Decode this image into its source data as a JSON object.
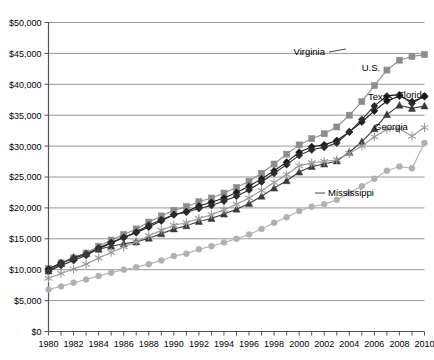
{
  "chart_data": {
    "type": "line",
    "title": "",
    "subtitle": "",
    "xlabel": "",
    "ylabel": "",
    "xlim": [
      1980,
      2010
    ],
    "ylim": [
      0,
      50000
    ],
    "ytick_values": [
      0,
      5000,
      10000,
      15000,
      20000,
      25000,
      30000,
      35000,
      40000,
      45000,
      50000
    ],
    "ytick_labels": [
      "$0",
      "$5,000",
      "$10,000",
      "$15,000",
      "$20,000",
      "$25,000",
      "$30,000",
      "$35,000",
      "$40,000",
      "$45,000",
      "$50,000"
    ],
    "xtick_labels": [
      "1980",
      "1982",
      "1984",
      "1986",
      "1988",
      "1990",
      "1992",
      "1994",
      "1996",
      "1998",
      "2000",
      "2002",
      "2004",
      "2006",
      "2008",
      "2010"
    ],
    "xtick_values": [
      1980,
      1982,
      1984,
      1986,
      1988,
      1990,
      1992,
      1994,
      1996,
      1998,
      2000,
      2002,
      2004,
      2006,
      2008,
      2010
    ],
    "grid": true,
    "legend_position": "inline-annotations",
    "x": [
      1980,
      1981,
      1982,
      1983,
      1984,
      1985,
      1986,
      1987,
      1988,
      1989,
      1990,
      1991,
      1992,
      1993,
      1994,
      1995,
      1996,
      1997,
      1998,
      1999,
      2000,
      2001,
      2002,
      2003,
      2004,
      2005,
      2006,
      2007,
      2008,
      2009,
      2010
    ],
    "series": [
      {
        "name": "Virginia",
        "color": "#8c8c8c",
        "marker": "square",
        "values": [
          10200,
          11100,
          11900,
          12700,
          13800,
          14800,
          15700,
          16600,
          17700,
          18700,
          19600,
          20200,
          21000,
          21600,
          22400,
          23300,
          24300,
          25600,
          27100,
          28700,
          30200,
          31200,
          32000,
          33100,
          35000,
          37200,
          39800,
          42300,
          43900,
          44500,
          44800
        ]
      },
      {
        "name": "U.S.",
        "color": "#1a1a1a",
        "marker": "diamond",
        "values": [
          10100,
          11100,
          11800,
          12500,
          13500,
          14400,
          15200,
          16000,
          16900,
          17900,
          18900,
          19400,
          20300,
          20900,
          21600,
          22500,
          23500,
          24700,
          26000,
          27400,
          29000,
          29900,
          30200,
          30900,
          32300,
          33900,
          35700,
          37300,
          38100,
          37200,
          38000
        ]
      },
      {
        "name": "Florida",
        "color": "#2b2b2b",
        "marker": "diamond",
        "values": [
          9700,
          10700,
          11500,
          12300,
          13400,
          14300,
          15200,
          16100,
          17200,
          18100,
          18900,
          19300,
          19900,
          20400,
          21100,
          21900,
          22900,
          24200,
          25600,
          27000,
          28500,
          29400,
          29800,
          30500,
          32300,
          34300,
          36500,
          38100,
          38300,
          36900,
          38100
        ]
      },
      {
        "name": "Texas",
        "color": "#3a3a3a",
        "marker": "triangle",
        "values": [
          9800,
          11000,
          12000,
          12600,
          13300,
          13800,
          14200,
          14500,
          15100,
          15800,
          16600,
          17100,
          17800,
          18300,
          19000,
          19800,
          20700,
          21900,
          23200,
          24400,
          25800,
          26700,
          27100,
          27600,
          29000,
          30700,
          32800,
          35100,
          36600,
          36100,
          36500
        ]
      },
      {
        "name": "Georgia",
        "color": "#9a9a9a",
        "marker": "asterisk",
        "values": [
          8600,
          9400,
          10100,
          10900,
          11900,
          12800,
          13700,
          14500,
          15500,
          16400,
          17200,
          17600,
          18300,
          18900,
          19700,
          20600,
          21600,
          22800,
          24100,
          25400,
          26800,
          27300,
          27500,
          27800,
          28800,
          30000,
          31500,
          32700,
          32800,
          31600,
          33000
        ]
      },
      {
        "name": "Mississippi",
        "color": "#b0b0b0",
        "marker": "circle",
        "values": [
          6800,
          7300,
          7900,
          8400,
          9000,
          9500,
          10000,
          10400,
          10900,
          11500,
          12200,
          12600,
          13300,
          13800,
          14400,
          15000,
          15700,
          16600,
          17600,
          18500,
          19500,
          20200,
          20600,
          21300,
          22400,
          23500,
          24700,
          26000,
          26700,
          26400,
          30500
        ]
      }
    ],
    "annotations": [
      {
        "text": "Virginia",
        "x": 325,
        "y": 55,
        "anchor": "end",
        "leader": {
          "x1": 329,
          "y1": 52,
          "x2": 346,
          "y2": 49
        }
      },
      {
        "text": "U.S.",
        "x": 371,
        "y": 71,
        "anchor": "middle",
        "leader": null
      },
      {
        "text": "Florida",
        "x": 398,
        "y": 98,
        "anchor": "start",
        "leader": {
          "x1": 391,
          "y1": 95,
          "x2": 396,
          "y2": 95
        }
      },
      {
        "text": "Texas",
        "x": 368,
        "y": 100,
        "anchor": "start",
        "leader": null
      },
      {
        "text": "Georgia",
        "x": 374,
        "y": 130,
        "anchor": "start",
        "leader": null
      },
      {
        "text": "Mississippi",
        "x": 328,
        "y": 196,
        "anchor": "start",
        "leader": {
          "x1": 315,
          "y1": 193,
          "x2": 325,
          "y2": 193
        }
      }
    ]
  }
}
